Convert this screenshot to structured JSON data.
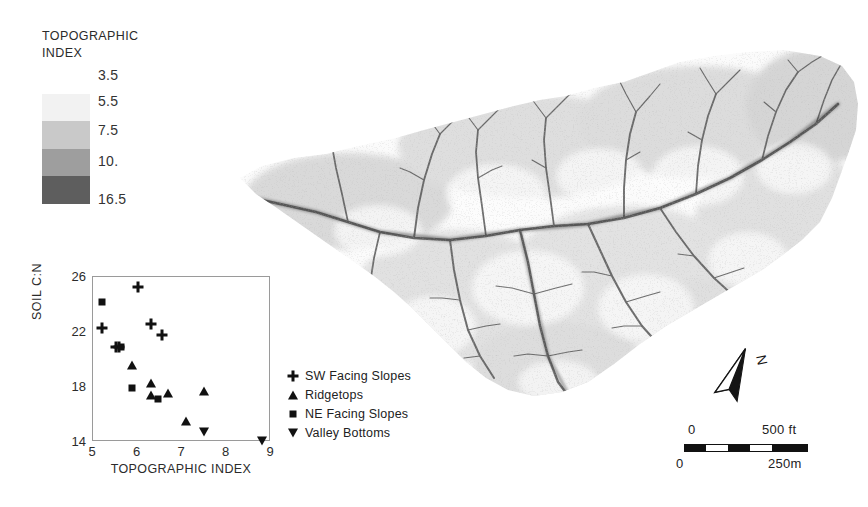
{
  "figure": {
    "kind": "map-figure-with-inset-scatter"
  },
  "topo_legend": {
    "title_line1": "TOPOGRAPHIC",
    "title_line2": "INDEX",
    "ticks": [
      "3.5",
      "5.5",
      "7.5",
      "10.",
      "16.5"
    ],
    "band_colors": [
      "#f2f2f2",
      "#c9c9c9",
      "#9e9e9e",
      "#5e5e5e"
    ]
  },
  "chart_data": {
    "type": "scatter",
    "title": "",
    "xlabel": "TOPOGRAPHIC INDEX",
    "ylabel": "SOIL C:N",
    "xlim": [
      5,
      9
    ],
    "ylim": [
      14,
      26
    ],
    "xticks": [
      "5",
      "6",
      "7",
      "8",
      "9"
    ],
    "yticks": [
      "14",
      "18",
      "22",
      "26"
    ],
    "grid": false,
    "legend_position": "right-outside",
    "series": [
      {
        "name": "SW Facing Slopes",
        "marker": "plus",
        "points": [
          [
            5.2,
            22.3
          ],
          [
            5.52,
            20.9
          ],
          [
            5.58,
            20.9
          ],
          [
            6.0,
            25.3
          ],
          [
            6.3,
            22.6
          ],
          [
            6.55,
            21.8
          ]
        ]
      },
      {
        "name": "Ridgetops",
        "marker": "triangle",
        "points": [
          [
            5.88,
            19.6
          ],
          [
            6.3,
            18.3
          ],
          [
            6.3,
            17.4
          ],
          [
            6.68,
            17.6
          ],
          [
            7.1,
            15.5
          ],
          [
            7.5,
            17.7
          ]
        ]
      },
      {
        "name": "NE Facing Slopes",
        "marker": "square",
        "points": [
          [
            5.2,
            24.2
          ],
          [
            5.63,
            20.9
          ],
          [
            5.87,
            17.9
          ],
          [
            6.45,
            17.1
          ]
        ]
      },
      {
        "name": "Valley Bottoms",
        "marker": "inverted-triangle",
        "points": [
          [
            7.5,
            14.7
          ],
          [
            8.8,
            14.05
          ]
        ]
      }
    ]
  },
  "north_arrow": {
    "label": "N"
  },
  "scale_bar": {
    "top_left_label": "0",
    "top_right_label": "500 ft",
    "bottom_left_label": "0",
    "bottom_right_label": "250m"
  }
}
